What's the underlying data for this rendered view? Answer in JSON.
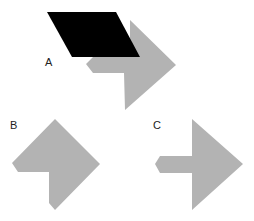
{
  "figure": {
    "colors": {
      "background": "#ffffff",
      "gray_shape": "#b3b3b3",
      "black_shape": "#000000",
      "label": "#222222"
    },
    "labels": {
      "a": "A",
      "b": "B",
      "c": "C"
    },
    "shapes": {
      "a_parallelogram": "47,12 116,12 140,57 72,57",
      "a_gray": "130,20 176,65 125,110 124,73 93,73 86,64 93,57 130,57",
      "b_gray": "55,119 100,164 55,210 49,203 49,172 18,172 12,163 55,119",
      "c_gray": "192,119 243,164 192,210 192,173 160,173 155,164 160,156 192,156"
    }
  }
}
